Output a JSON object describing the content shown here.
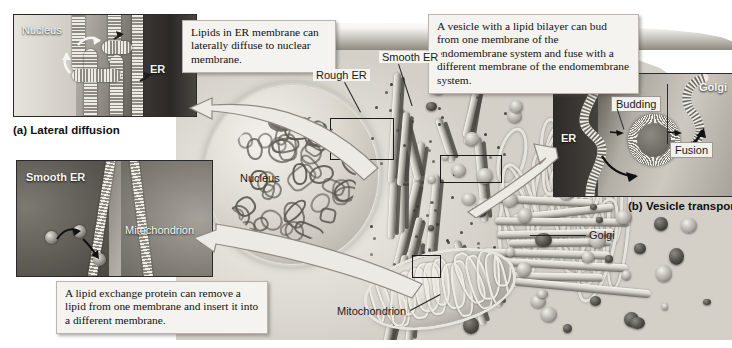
{
  "figure": {
    "background_color": "#ffffff",
    "style": "grayscale textbook illustration"
  },
  "panels": [
    {
      "id": "a",
      "caption": "(a) Lateral diffusion",
      "labels": [
        {
          "name": "nucleus",
          "text": "Nucleus"
        },
        {
          "name": "er",
          "text": "ER"
        }
      ]
    },
    {
      "id": "b",
      "caption": "",
      "labels": [
        {
          "name": "smooth-er",
          "text": "Smooth ER"
        },
        {
          "name": "mitochondrion",
          "text": "Mitochondrion"
        }
      ]
    },
    {
      "id": "c",
      "caption": "(b) Vesicle transport",
      "labels": [
        {
          "name": "golgi",
          "text": "Golgi"
        },
        {
          "name": "budding",
          "text": "Budding"
        },
        {
          "name": "fusion",
          "text": "Fusion"
        },
        {
          "name": "er",
          "text": "ER"
        }
      ]
    }
  ],
  "callouts": [
    {
      "id": "lateral-diffusion",
      "text": "Lipids in ER membrane can laterally diffuse to nuclear membrane."
    },
    {
      "id": "vesicle-budding-fusion",
      "text": "A vesicle with a lipid bilayer can bud from one membrane of the endomembrane system and fuse with a different membrane of the endomembrane system."
    },
    {
      "id": "lipid-exchange-protein",
      "text": "A lipid exchange protein can remove a lipid from one membrane and insert it into a different membrane."
    }
  ],
  "cell_labels": [
    {
      "name": "rough-er",
      "text": "Rough ER"
    },
    {
      "name": "smooth-er",
      "text": "Smooth ER"
    },
    {
      "name": "nucleus",
      "text": "Nucleus"
    },
    {
      "name": "golgi",
      "text": "Golgi"
    },
    {
      "name": "mitochondrion",
      "text": "Mitochondrion"
    }
  ],
  "colors": {
    "page_background": "#ffffff",
    "callout_background": "#f4f3f0",
    "callout_border": "#b9b5ad",
    "panel_border": "#2a2a2a",
    "text": "#111111",
    "label_light": "#f7f6f3"
  }
}
